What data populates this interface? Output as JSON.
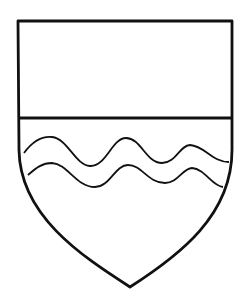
{
  "figure": {
    "colors": {
      "background": "#ffffff",
      "stroke": "#111111"
    },
    "parts": {
      "chief": "plain rectangular chief at top",
      "field": "lower field with two wavy lines",
      "wavy_lines_count": 2
    }
  }
}
